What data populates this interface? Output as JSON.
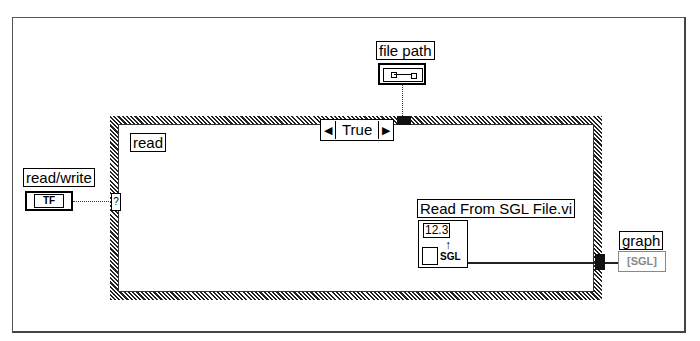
{
  "diagram": {
    "case_structure": {
      "selector_value": "True",
      "left_arrow": "◀",
      "right_arrow": "▶",
      "frame_label": "read"
    },
    "controls": [
      {
        "label": "file path",
        "icon": "path-icon"
      },
      {
        "label": "read/write",
        "icon_text": "TF"
      }
    ],
    "indicators": [
      {
        "label": "graph",
        "icon_text": "[SGL]"
      }
    ],
    "subvi": {
      "label": "Read From SGL File.vi",
      "icon_top": "12.3",
      "icon_bottom": "SGL"
    },
    "selector_terminal": "?"
  }
}
